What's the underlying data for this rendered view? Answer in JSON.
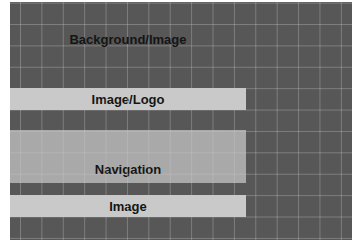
{
  "diagram": {
    "regions": [
      {
        "id": "background",
        "label": "Background/Image",
        "color": "#575757"
      },
      {
        "id": "logo",
        "label": "Image/Logo",
        "color": "#c9c9c9"
      },
      {
        "id": "navigation",
        "label": "Navigation",
        "color": "#a9a9a9"
      },
      {
        "id": "image",
        "label": "Image",
        "color": "#c9c9c9"
      }
    ]
  }
}
